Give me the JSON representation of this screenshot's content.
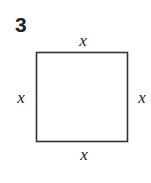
{
  "problem_number": "3",
  "figure": {
    "shape": "square",
    "labels": {
      "top": "x",
      "left": "x",
      "right": "x",
      "bottom": "x"
    },
    "stroke_color": "#333333"
  }
}
